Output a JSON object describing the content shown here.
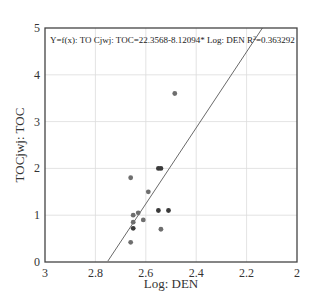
{
  "chart_data": {
    "type": "scatter",
    "title": "",
    "annotation": "Y=f(x): TO Cjwj: TOC=22.3568-8.12094* Log: DEN  R²=0.363292",
    "xlabel": "Log: DEN",
    "ylabel": "TOCjwj: TOC",
    "xlim": [
      3,
      2
    ],
    "ylim": [
      0,
      5
    ],
    "x_reversed": true,
    "x_ticks": [
      "3",
      "2.8",
      "2.6",
      "2.4",
      "2.2",
      "2"
    ],
    "y_ticks": [
      "0",
      "1",
      "2",
      "3",
      "4",
      "5"
    ],
    "grid": true,
    "legend": null,
    "series": [
      {
        "name": "TOC vs Log DEN",
        "points": [
          {
            "x": 2.485,
            "y": 3.6
          },
          {
            "x": 2.66,
            "y": 1.8
          },
          {
            "x": 2.59,
            "y": 1.5
          },
          {
            "x": 2.55,
            "y": 2.0
          },
          {
            "x": 2.54,
            "y": 2.0
          },
          {
            "x": 2.65,
            "y": 1.0
          },
          {
            "x": 2.63,
            "y": 1.05
          },
          {
            "x": 2.61,
            "y": 0.9
          },
          {
            "x": 2.65,
            "y": 0.85
          },
          {
            "x": 2.65,
            "y": 0.72
          },
          {
            "x": 2.55,
            "y": 1.1
          },
          {
            "x": 2.51,
            "y": 1.1
          },
          {
            "x": 2.54,
            "y": 0.7
          },
          {
            "x": 2.66,
            "y": 0.42
          }
        ]
      }
    ],
    "fit": {
      "type": "linear",
      "intercept": 22.3568,
      "slope": -8.12094,
      "r2": 0.363292
    }
  }
}
